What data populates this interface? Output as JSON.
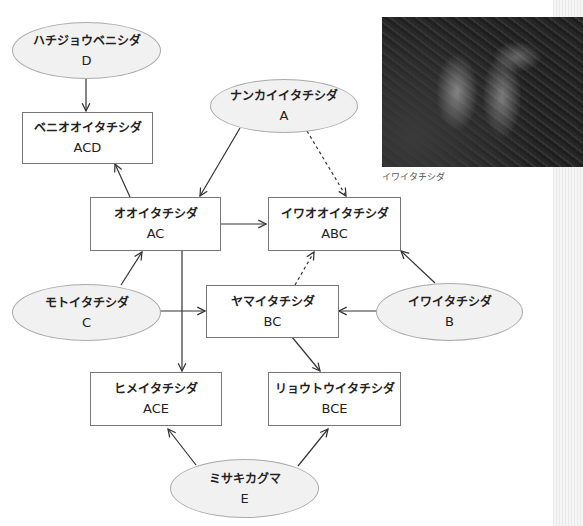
{
  "figure": {
    "photo_caption": "イワイタチシダ",
    "photo_alt": "fern-photo"
  },
  "nodes": {
    "D": {
      "name": "ハチジョウベニシダ",
      "code": "D"
    },
    "ACD": {
      "name": "ベニオオイタチシダ",
      "code": "ACD"
    },
    "A": {
      "name": "ナンカイイタチシダ",
      "code": "A"
    },
    "AC": {
      "name": "オオイタチシダ",
      "code": "AC"
    },
    "ABC": {
      "name": "イワオオイタチシダ",
      "code": "ABC"
    },
    "C": {
      "name": "モトイタチシダ",
      "code": "C"
    },
    "BC": {
      "name": "ヤマイタチシダ",
      "code": "BC"
    },
    "B": {
      "name": "イワイタチシダ",
      "code": "B"
    },
    "ACE": {
      "name": "ヒメイタチシダ",
      "code": "ACE"
    },
    "BCE": {
      "name": "リョウトウイタチシダ",
      "code": "BCE"
    },
    "E": {
      "name": "ミサキカグマ",
      "code": "E"
    }
  },
  "edges": [
    {
      "from": "D",
      "to": "ACD",
      "style": "solid"
    },
    {
      "from": "AC",
      "to": "ACD",
      "style": "solid"
    },
    {
      "from": "A",
      "to": "AC",
      "style": "solid"
    },
    {
      "from": "A",
      "to": "ABC",
      "style": "dashed"
    },
    {
      "from": "AC",
      "to": "ABC",
      "style": "solid"
    },
    {
      "from": "C",
      "to": "AC",
      "style": "solid"
    },
    {
      "from": "C",
      "to": "BC",
      "style": "solid"
    },
    {
      "from": "AC",
      "to": "ACE",
      "style": "solid"
    },
    {
      "from": "BC",
      "to": "ABC",
      "style": "dashed"
    },
    {
      "from": "B",
      "to": "BC",
      "style": "solid"
    },
    {
      "from": "B",
      "to": "ABC",
      "style": "solid"
    },
    {
      "from": "BC",
      "to": "BCE",
      "style": "solid"
    },
    {
      "from": "E",
      "to": "ACE",
      "style": "solid"
    },
    {
      "from": "E",
      "to": "BCE",
      "style": "solid"
    }
  ],
  "colors": {
    "box_border": "#777777",
    "ellipse_fill": "#f1f1f1",
    "line": "#333333"
  }
}
